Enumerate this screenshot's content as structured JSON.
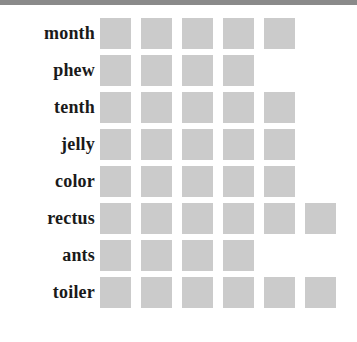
{
  "top_bar": {
    "color": "#8a8a8a"
  },
  "colors": {
    "mark": "#cbcbcb",
    "label": "#1a1a1a",
    "background": "#ffffff",
    "top_bar": "#8a8a8a"
  },
  "chart_data": {
    "type": "bar",
    "title": "",
    "subtitle": "",
    "xlabel": "",
    "ylabel": "",
    "orientation": "horizontal",
    "style": "pictogram-squares",
    "grid": false,
    "legend": null,
    "unit_per_mark": 1,
    "xlim": [
      0,
      6
    ],
    "categories": [
      "month",
      "phew",
      "tenth",
      "jelly",
      "color",
      "rectus",
      "ants",
      "toiler"
    ],
    "values": [
      5,
      4,
      5,
      5,
      5,
      6,
      4,
      6
    ],
    "rows": [
      {
        "label": "month",
        "value": 5
      },
      {
        "label": "phew",
        "value": 4
      },
      {
        "label": "tenth",
        "value": 5
      },
      {
        "label": "jelly",
        "value": 5
      },
      {
        "label": "color",
        "value": 5
      },
      {
        "label": "rectus",
        "value": 6
      },
      {
        "label": "ants",
        "value": 4
      },
      {
        "label": "toiler",
        "value": 6
      }
    ]
  },
  "layout": {
    "label_column_width": 95,
    "marks_left": 100,
    "mark_size": 31,
    "column_pitch": 41,
    "row_pitch": 37,
    "first_row_top": 13
  }
}
